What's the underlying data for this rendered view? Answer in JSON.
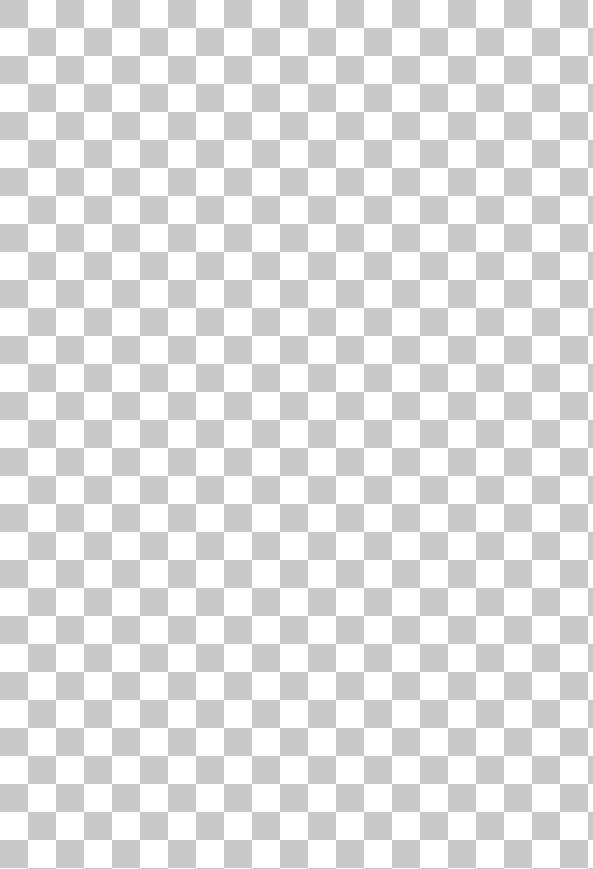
{
  "canvas": {
    "description": "Empty transparent canvas (checkerboard transparency pattern)",
    "width": 593,
    "height": 869,
    "pattern": {
      "type": "checkerboard",
      "square_size_px": 28,
      "light_color": "#ffffff",
      "dark_color": "#c9c9c9"
    }
  }
}
